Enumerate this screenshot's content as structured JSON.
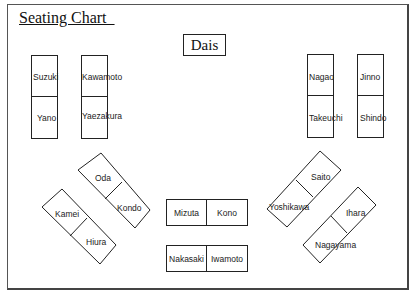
{
  "title": "Seating Chart  ",
  "dais": "Dais",
  "vertical_desks": [
    {
      "id": "suzuki-yano",
      "seats": [
        "Suzuki",
        "Yano"
      ]
    },
    {
      "id": "kawamoto-yaezakura",
      "seats": [
        "Kawamoto",
        "Yaezakura"
      ]
    },
    {
      "id": "nagao-takeuchi",
      "seats": [
        "Nagao",
        "Takeuchi"
      ]
    },
    {
      "id": "jinno-shindo",
      "seats": [
        "Jinno",
        "Shindo"
      ]
    }
  ],
  "center_desks": [
    {
      "id": "mizuta-kono",
      "seats": [
        "Mizuta",
        "Kono"
      ]
    },
    {
      "id": "nakasaki-iwamoto",
      "seats": [
        "Nakasaki",
        "Iwamoto"
      ]
    }
  ],
  "diagonal_desks": [
    {
      "id": "oda-kondo",
      "seats": [
        "Oda",
        "Kondo"
      ]
    },
    {
      "id": "kamei-hiura",
      "seats": [
        "Kamei",
        "Hiura"
      ]
    },
    {
      "id": "saito-yoshikawa",
      "seats": [
        "Saito",
        "Yoshikawa"
      ]
    },
    {
      "id": "ihara-nagayama",
      "seats": [
        "Ihara",
        "Nagayama"
      ]
    }
  ],
  "colors": {
    "line": "#222222",
    "text": "#222222",
    "background": "#ffffff"
  }
}
